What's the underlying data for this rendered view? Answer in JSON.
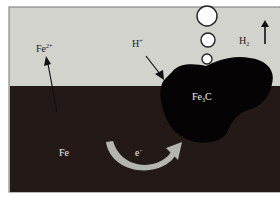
{
  "diagram": {
    "title": "",
    "colors": {
      "electrolyte": "#d3d3ce",
      "metal": "#231a18",
      "cementite": "#050303",
      "frame": "#8a8a86",
      "electron_arrow": "#b5b5b0",
      "bubble_fill": "#ffffff",
      "bubble_stroke": "#222222",
      "label_dark": "#1a1a1a",
      "label_light": "#f0f0f0"
    },
    "labels": {
      "fe_ion": "Fe",
      "fe_ion_charge": "2+",
      "h_ion": "H",
      "h_ion_charge": "+",
      "h2": "H",
      "h2_sub": "2",
      "fe": "Fe",
      "electron": "e",
      "electron_charge": "−",
      "cementite": "Fe",
      "cementite_sub": "3",
      "cementite_suffix": "C"
    },
    "regions": [
      {
        "name": "electrolyte",
        "description": "solution above metal"
      },
      {
        "name": "iron-matrix",
        "description": "Fe metal"
      },
      {
        "name": "cementite-particle",
        "description": "Fe3C"
      }
    ],
    "bubbles": [
      {
        "cx": 207,
        "cy": 16,
        "r": 10
      },
      {
        "cx": 208,
        "cy": 40,
        "r": 7
      },
      {
        "cx": 207,
        "cy": 59,
        "r": 5
      }
    ]
  }
}
